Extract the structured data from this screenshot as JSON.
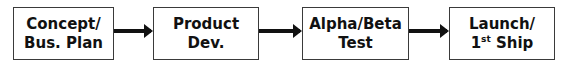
{
  "diagram": {
    "type": "process-flow",
    "steps": [
      {
        "line1": "Concept/",
        "line2": "Bus. Plan"
      },
      {
        "line1": "Product",
        "line2": "Dev."
      },
      {
        "line1": "Alpha/Beta",
        "line2": "Test"
      },
      {
        "line1": "Launch/",
        "line2_prefix": "1",
        "line2_sup": "st",
        "line2_suffix": " Ship"
      }
    ],
    "connectors": [
      "arrow",
      "arrow",
      "arrow"
    ],
    "colors": {
      "border": "#3a3a3a",
      "arrow": "#111111",
      "text": "#111111",
      "background": "#ffffff"
    }
  }
}
